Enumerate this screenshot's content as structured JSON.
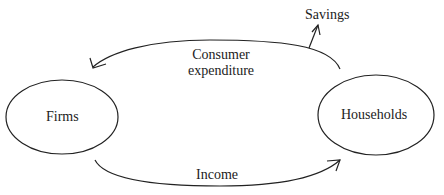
{
  "diagram": {
    "type": "circular-flow",
    "nodes": [
      {
        "id": "firms",
        "label": "Firms"
      },
      {
        "id": "households",
        "label": "Households"
      }
    ],
    "flows": [
      {
        "id": "consumer-expenditure",
        "label_line1": "Consumer",
        "label_line2": "expenditure",
        "from": "households",
        "to": "firms"
      },
      {
        "id": "income",
        "label": "Income",
        "from": "firms",
        "to": "households"
      },
      {
        "id": "savings",
        "label": "Savings",
        "from": "consumer-expenditure",
        "to": "outside"
      }
    ],
    "colors": {
      "stroke": "#222222",
      "background": "#ffffff",
      "text": "#222222"
    }
  }
}
